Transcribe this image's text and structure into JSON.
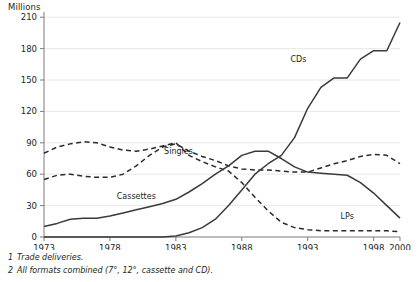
{
  "chart_data": {
    "type": "line",
    "title": "",
    "ylabel": "Millions",
    "xlabel": "",
    "ylim": [
      0,
      215
    ],
    "xlim": [
      1973,
      2000
    ],
    "yticks": [
      0,
      30,
      60,
      90,
      120,
      150,
      180,
      210
    ],
    "ytick_labels": [
      "0",
      "30",
      "60",
      "90",
      "120",
      "150",
      "180",
      "210"
    ],
    "xticks": [
      1973,
      1978,
      1983,
      1988,
      1993,
      1998,
      2000
    ],
    "xtick_labels": [
      "1973",
      "1978",
      "1983",
      "1988",
      "1993",
      "1998",
      "2000"
    ],
    "grid": "horizontal",
    "legend": "inline-labels",
    "x": [
      1973,
      1974,
      1975,
      1976,
      1977,
      1978,
      1979,
      1980,
      1981,
      1982,
      1983,
      1984,
      1985,
      1986,
      1987,
      1988,
      1989,
      1990,
      1991,
      1992,
      1993,
      1994,
      1995,
      1996,
      1997,
      1998,
      1999,
      2000
    ],
    "series": [
      {
        "name": "LPs",
        "label": "LPs",
        "style": "dashed",
        "color": "#2b2b2b",
        "label_x": 1996.0,
        "label_y": 17,
        "values": [
          80,
          86,
          89,
          91,
          90,
          86,
          83,
          82,
          84,
          87,
          90,
          78,
          72,
          67,
          63,
          52,
          38,
          25,
          14,
          9,
          7,
          6,
          6,
          6,
          6,
          6,
          6,
          5
        ]
      },
      {
        "name": "Singles",
        "label": "Singles",
        "style": "dashed",
        "color": "#2b2b2b",
        "label_x": 1983.2,
        "label_y": 79,
        "values": [
          55,
          59,
          60,
          58,
          57,
          57,
          60,
          68,
          78,
          86,
          89,
          82,
          77,
          73,
          68,
          65,
          64,
          64,
          63,
          62,
          62,
          66,
          70,
          73,
          77,
          79,
          78,
          70
        ]
      },
      {
        "name": "Cassettes",
        "label": "Cassettes",
        "style": "solid",
        "color": "#3a3a3a",
        "label_x": 1980.0,
        "label_y": 36,
        "values": [
          10,
          13,
          17,
          18,
          18,
          20,
          23,
          26,
          29,
          32,
          36,
          43,
          51,
          60,
          68,
          78,
          82,
          82,
          75,
          67,
          62,
          61,
          60,
          59,
          52,
          42,
          30,
          18
        ]
      },
      {
        "name": "CDs",
        "label": "CDs",
        "style": "solid",
        "color": "#3a3a3a",
        "label_x": 1992.3,
        "label_y": 167,
        "values": [
          0,
          0,
          0,
          0,
          0,
          0,
          0,
          0,
          0,
          0,
          1,
          4,
          9,
          17,
          30,
          45,
          60,
          70,
          78,
          95,
          123,
          143,
          152,
          152,
          170,
          178,
          178,
          205
        ]
      }
    ]
  },
  "footnotes": [
    {
      "num": "1",
      "text": "Trade deliveries."
    },
    {
      "num": "2",
      "text": "All formats combined (7°, 12°, cassette and CD)."
    }
  ],
  "colors": {
    "gridline": "#e8e8e8",
    "axis": "#7a7a7a",
    "text": "#231f20"
  }
}
